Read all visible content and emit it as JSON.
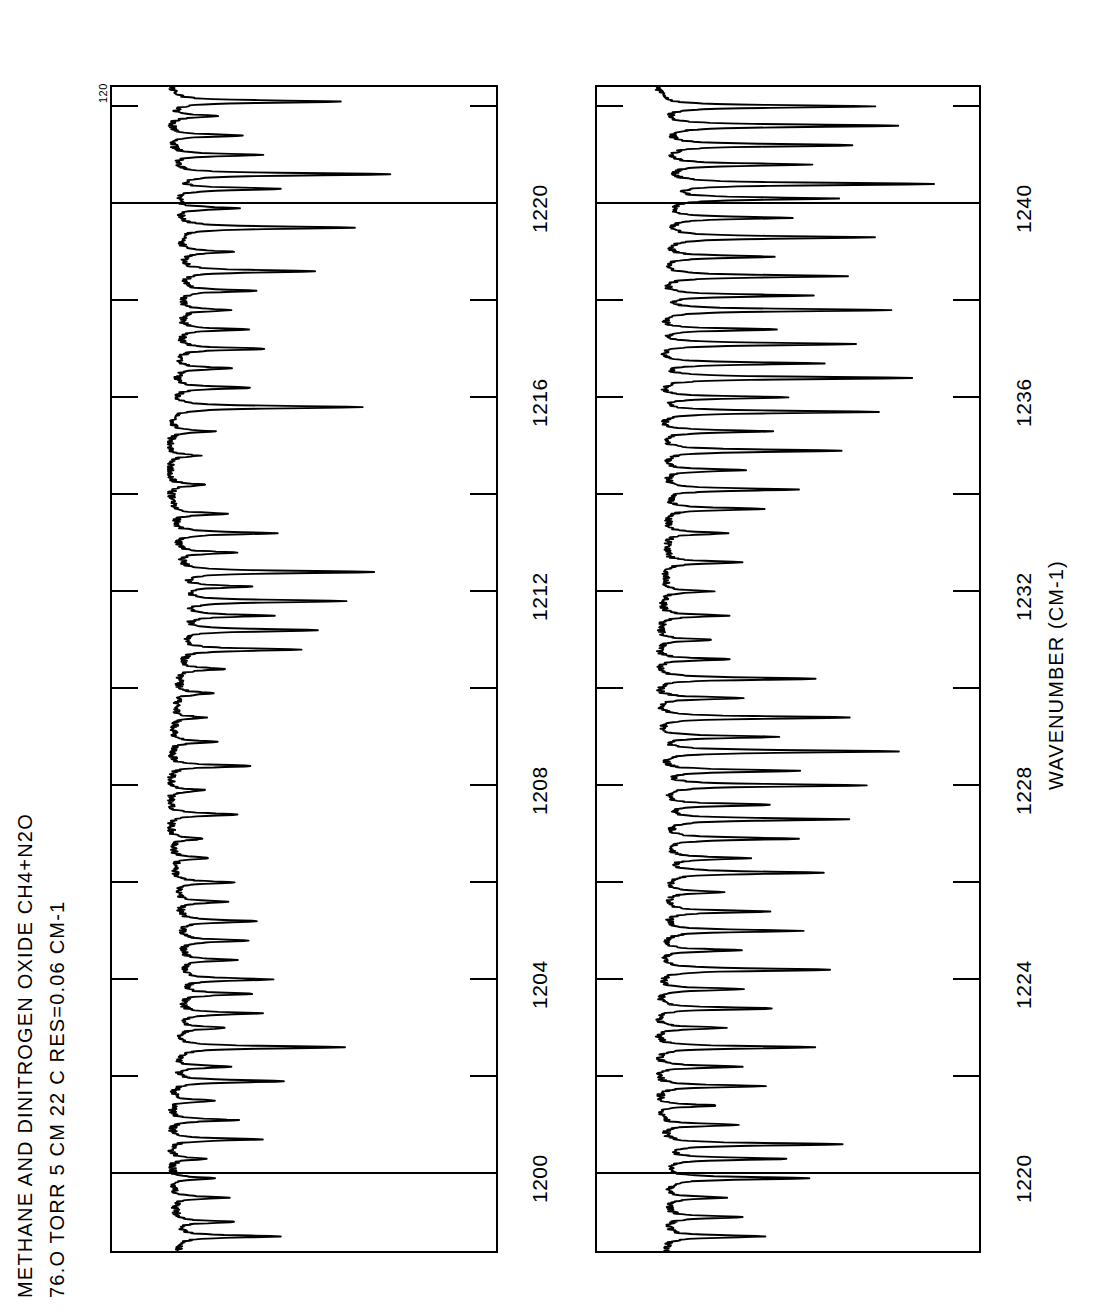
{
  "title": {
    "line1": "METHANE AND DINITROGEN OXIDE  CH4+N2O",
    "line2": "76.O  TORR  5 CM  22 C      RES=0.06 CM-1"
  },
  "y_axis": {
    "top_label": "120"
  },
  "axis_title": "WAVENUMBER (CM-1)",
  "chart_data": {
    "type": "line",
    "title": "METHANE AND DINITROGEN OXIDE  CH4+N2O",
    "subtitle": "76.O  TORR  5 CM  22 C      RES=0.06 CM-1",
    "xlabel": "WAVENUMBER (CM-1)",
    "ylabel": "TRANSMITTANCE",
    "orientation": "rotated-90-ccw",
    "grid": true,
    "legend": null,
    "ylim": [
      0,
      120
    ],
    "y_top_tick": 120,
    "panels": [
      {
        "name": "top-panel",
        "xlim": [
          1198.4,
          1222.4
        ],
        "xticks_major": [
          1200,
          1204,
          1208,
          1212,
          1216,
          1220
        ],
        "xticks_minor_step": 2,
        "gridlines_full_width": [
          1200,
          1220
        ],
        "peaks": [
          {
            "x": 1198.7,
            "depth": 34
          },
          {
            "x": 1199.0,
            "depth": 20
          },
          {
            "x": 1199.5,
            "depth": 18
          },
          {
            "x": 1199.9,
            "depth": 14
          },
          {
            "x": 1200.3,
            "depth": 13
          },
          {
            "x": 1200.7,
            "depth": 30
          },
          {
            "x": 1201.1,
            "depth": 22
          },
          {
            "x": 1201.5,
            "depth": 15
          },
          {
            "x": 1201.9,
            "depth": 38
          },
          {
            "x": 1202.2,
            "depth": 18
          },
          {
            "x": 1202.6,
            "depth": 57
          },
          {
            "x": 1203.0,
            "depth": 16
          },
          {
            "x": 1203.3,
            "depth": 28
          },
          {
            "x": 1203.7,
            "depth": 24
          },
          {
            "x": 1204.0,
            "depth": 30
          },
          {
            "x": 1204.4,
            "depth": 18
          },
          {
            "x": 1204.8,
            "depth": 22
          },
          {
            "x": 1205.2,
            "depth": 26
          },
          {
            "x": 1205.6,
            "depth": 16
          },
          {
            "x": 1206.0,
            "depth": 20
          },
          {
            "x": 1206.5,
            "depth": 13
          },
          {
            "x": 1206.9,
            "depth": 11
          },
          {
            "x": 1207.4,
            "depth": 24
          },
          {
            "x": 1207.9,
            "depth": 12
          },
          {
            "x": 1208.4,
            "depth": 28
          },
          {
            "x": 1208.9,
            "depth": 14
          },
          {
            "x": 1209.4,
            "depth": 10
          },
          {
            "x": 1209.9,
            "depth": 12
          },
          {
            "x": 1210.4,
            "depth": 15
          },
          {
            "x": 1210.8,
            "depth": 40
          },
          {
            "x": 1211.2,
            "depth": 46
          },
          {
            "x": 1211.5,
            "depth": 30
          },
          {
            "x": 1211.8,
            "depth": 55
          },
          {
            "x": 1212.1,
            "depth": 24
          },
          {
            "x": 1212.4,
            "depth": 66
          },
          {
            "x": 1212.8,
            "depth": 20
          },
          {
            "x": 1213.2,
            "depth": 34
          },
          {
            "x": 1213.6,
            "depth": 18
          },
          {
            "x": 1214.2,
            "depth": 12
          },
          {
            "x": 1214.8,
            "depth": 10
          },
          {
            "x": 1215.3,
            "depth": 14
          },
          {
            "x": 1215.8,
            "depth": 64
          },
          {
            "x": 1216.2,
            "depth": 26
          },
          {
            "x": 1216.6,
            "depth": 18
          },
          {
            "x": 1217.0,
            "depth": 30
          },
          {
            "x": 1217.4,
            "depth": 22
          },
          {
            "x": 1217.8,
            "depth": 16
          },
          {
            "x": 1218.2,
            "depth": 24
          },
          {
            "x": 1218.6,
            "depth": 44
          },
          {
            "x": 1219.0,
            "depth": 18
          },
          {
            "x": 1219.5,
            "depth": 60
          },
          {
            "x": 1219.9,
            "depth": 20
          },
          {
            "x": 1220.3,
            "depth": 36
          },
          {
            "x": 1220.6,
            "depth": 72
          },
          {
            "x": 1221.0,
            "depth": 30
          },
          {
            "x": 1221.4,
            "depth": 24
          },
          {
            "x": 1221.8,
            "depth": 16
          },
          {
            "x": 1222.1,
            "depth": 58
          }
        ]
      },
      {
        "name": "bottom-panel",
        "xlim": [
          1218.4,
          1242.4
        ],
        "xticks_major": [
          1220,
          1224,
          1228,
          1232,
          1236,
          1240
        ],
        "xticks_minor_step": 2,
        "gridlines_full_width": [
          1220,
          1240
        ],
        "peaks": [
          {
            "x": 1218.7,
            "depth": 34
          },
          {
            "x": 1219.1,
            "depth": 26
          },
          {
            "x": 1219.5,
            "depth": 20
          },
          {
            "x": 1219.9,
            "depth": 48
          },
          {
            "x": 1220.3,
            "depth": 42
          },
          {
            "x": 1220.6,
            "depth": 60
          },
          {
            "x": 1221.0,
            "depth": 26
          },
          {
            "x": 1221.4,
            "depth": 20
          },
          {
            "x": 1221.8,
            "depth": 36
          },
          {
            "x": 1222.2,
            "depth": 28
          },
          {
            "x": 1222.6,
            "depth": 54
          },
          {
            "x": 1223.0,
            "depth": 24
          },
          {
            "x": 1223.4,
            "depth": 40
          },
          {
            "x": 1223.8,
            "depth": 30
          },
          {
            "x": 1224.2,
            "depth": 58
          },
          {
            "x": 1224.6,
            "depth": 26
          },
          {
            "x": 1225.0,
            "depth": 46
          },
          {
            "x": 1225.4,
            "depth": 34
          },
          {
            "x": 1225.8,
            "depth": 20
          },
          {
            "x": 1226.2,
            "depth": 52
          },
          {
            "x": 1226.5,
            "depth": 28
          },
          {
            "x": 1226.9,
            "depth": 44
          },
          {
            "x": 1227.3,
            "depth": 62
          },
          {
            "x": 1227.6,
            "depth": 36
          },
          {
            "x": 1228.0,
            "depth": 70
          },
          {
            "x": 1228.3,
            "depth": 48
          },
          {
            "x": 1228.7,
            "depth": 82
          },
          {
            "x": 1229.0,
            "depth": 40
          },
          {
            "x": 1229.4,
            "depth": 66
          },
          {
            "x": 1229.8,
            "depth": 30
          },
          {
            "x": 1230.2,
            "depth": 54
          },
          {
            "x": 1230.6,
            "depth": 24
          },
          {
            "x": 1231.0,
            "depth": 18
          },
          {
            "x": 1231.5,
            "depth": 22
          },
          {
            "x": 1232.0,
            "depth": 16
          },
          {
            "x": 1232.6,
            "depth": 26
          },
          {
            "x": 1233.2,
            "depth": 20
          },
          {
            "x": 1233.7,
            "depth": 34
          },
          {
            "x": 1234.1,
            "depth": 46
          },
          {
            "x": 1234.5,
            "depth": 28
          },
          {
            "x": 1234.9,
            "depth": 60
          },
          {
            "x": 1235.3,
            "depth": 38
          },
          {
            "x": 1235.7,
            "depth": 74
          },
          {
            "x": 1236.0,
            "depth": 44
          },
          {
            "x": 1236.4,
            "depth": 86
          },
          {
            "x": 1236.7,
            "depth": 56
          },
          {
            "x": 1237.1,
            "depth": 68
          },
          {
            "x": 1237.4,
            "depth": 40
          },
          {
            "x": 1237.8,
            "depth": 78
          },
          {
            "x": 1238.1,
            "depth": 50
          },
          {
            "x": 1238.5,
            "depth": 62
          },
          {
            "x": 1238.9,
            "depth": 36
          },
          {
            "x": 1239.3,
            "depth": 70
          },
          {
            "x": 1239.7,
            "depth": 42
          },
          {
            "x": 1240.1,
            "depth": 56
          },
          {
            "x": 1240.4,
            "depth": 90
          },
          {
            "x": 1240.8,
            "depth": 48
          },
          {
            "x": 1241.2,
            "depth": 64
          },
          {
            "x": 1241.6,
            "depth": 80
          },
          {
            "x": 1242.0,
            "depth": 72
          }
        ]
      }
    ]
  }
}
